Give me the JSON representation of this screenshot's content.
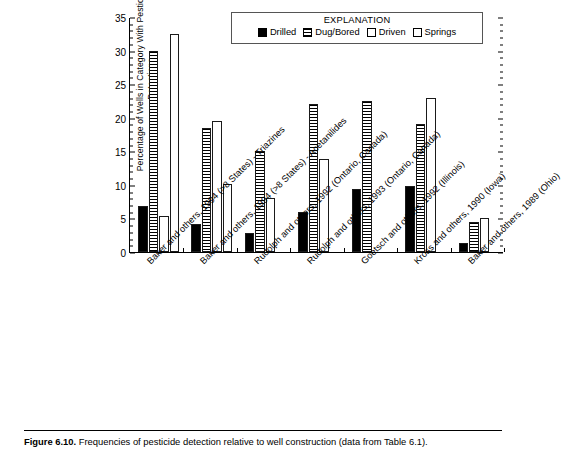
{
  "figure": {
    "caption_label": "Figure 6.10.",
    "caption_text": " Frequencies of pesticide detection relative to well construction (data from Table 6.1)."
  },
  "legend": {
    "title": "EXPLANATION",
    "items": [
      {
        "label": "Drilled",
        "swatch": "solid-black-square-icon"
      },
      {
        "label": "Dug/Bored",
        "swatch": "horizontal-hatch-square-icon"
      },
      {
        "label": "Driven",
        "swatch": "white-square-icon"
      },
      {
        "label": "Springs",
        "swatch": "white-square-icon"
      }
    ]
  },
  "chart_data": {
    "type": "bar",
    "title": "",
    "xlabel": "",
    "ylabel": "Percentage of Wells in Category With Pesticide Detections",
    "ylim": [
      0,
      35
    ],
    "ytick_step": 5,
    "yticks": [
      "0",
      "5",
      "10",
      "15",
      "20",
      "25",
      "30",
      "35"
    ],
    "grid": false,
    "legend_position": "top-right-inside",
    "categories": [
      "Baker and others, 1994 (>8 States) - Triazines",
      "Baker and others, 1994 (>8 States) - Acetanilides",
      "Rudolph and others, 1992 (Ontario, Canada)",
      "Rudolph and others, 1993 (Ontario, Canada)",
      "Goetsch and others, 1992 (Illinois)",
      "Kross and others, 1990 (Iowa)",
      "Baker and others, 1989 (Ohio)"
    ],
    "series": [
      {
        "name": "Drilled",
        "values": [
          6.8,
          4.1,
          2.9,
          5.9,
          9.4,
          9.8,
          1.4
        ]
      },
      {
        "name": "Dug/Bored",
        "values": [
          30.0,
          18.5,
          15.0,
          22.0,
          22.5,
          19.0,
          4.5
        ]
      },
      {
        "name": "Driven",
        "values": [
          5.3,
          19.5,
          8.0,
          13.9,
          null,
          22.9,
          5.1
        ]
      },
      {
        "name": "Springs",
        "values": [
          32.5,
          10.2,
          null,
          null,
          null,
          null,
          null
        ]
      }
    ]
  }
}
